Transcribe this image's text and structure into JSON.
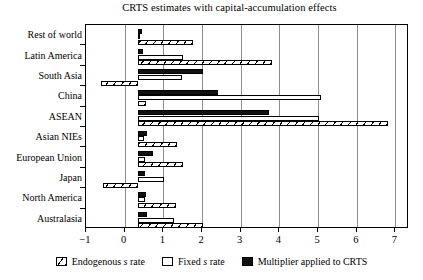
{
  "chart_data": {
    "type": "bar",
    "orientation": "horizontal",
    "title": "CRTS estimates with capital-accumulation effects",
    "xlabel": "",
    "ylabel": "",
    "xlim": [
      -1,
      7.35
    ],
    "xticks": [
      -1,
      0,
      1,
      2,
      3,
      4,
      5,
      6,
      7
    ],
    "xtick_labels": [
      "−1",
      "0",
      "1",
      "2",
      "3",
      "4",
      "5",
      "6",
      "7"
    ],
    "grid": "vertical",
    "bar_base": 0.35,
    "legend_position": "below",
    "categories": [
      "Rest of world",
      "Latin America",
      "South Asia",
      "China",
      "ASEAN",
      "Asian NIEs",
      "European Union",
      "Japan",
      "North America",
      "Australasia"
    ],
    "series": [
      {
        "name": "Multiplier applied to CRTS",
        "key": "multiplier",
        "values": [
          0.45,
          0.47,
          2.02,
          2.42,
          3.72,
          0.57,
          0.72,
          0.52,
          0.55,
          0.58
        ]
      },
      {
        "name": "Fixed s rate",
        "key": "fixed",
        "values": [
          0.38,
          1.52,
          1.47,
          5.08,
          5.02,
          0.5,
          0.52,
          1.02,
          0.52,
          1.27
        ]
      },
      {
        "name": "Endogenous s rate",
        "key": "endogenous",
        "values": [
          1.77,
          3.82,
          -0.6,
          0.55,
          6.82,
          1.35,
          1.5,
          -0.55,
          1.32,
          2.02
        ]
      }
    ]
  },
  "legend": {
    "entries": [
      {
        "label_pre": "Endogenous ",
        "label_em": "s",
        "label_post": " rate",
        "swatch": "endogenous"
      },
      {
        "label_pre": "Fixed ",
        "label_em": "s",
        "label_post": " rate",
        "swatch": "fixed"
      },
      {
        "label_pre": "Multiplier applied to CRTS",
        "label_em": "",
        "label_post": "",
        "swatch": "multiplier"
      }
    ]
  },
  "colors": {
    "bar_fill": "#ffffff",
    "bar_outline": "#000000",
    "multiplier_fill": "#111111",
    "gridline": "#8d8d8d",
    "background": "#ffffff"
  }
}
